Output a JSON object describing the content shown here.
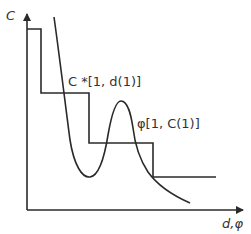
{
  "diagram": {
    "y_axis_label": "C",
    "x_axis_label": "d,φ",
    "step_label": "C *[1, d(1)]",
    "curve_label": "φ[1, C(1)]",
    "stroke_color": "#2a2a2a",
    "step_points": [
      [
        27,
        29
      ],
      [
        41,
        29
      ],
      [
        41,
        93
      ],
      [
        89,
        93
      ],
      [
        89,
        143
      ],
      [
        153,
        143
      ],
      [
        153,
        177
      ],
      [
        216,
        177
      ]
    ],
    "curve_description": "U-shaped curve descending from top-left, minimum near (90,177), peak near (120,101), decaying toward (190,203)"
  }
}
